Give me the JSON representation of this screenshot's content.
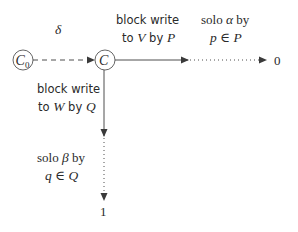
{
  "nodes": {
    "c0": {
      "label": "C",
      "subscript": "0"
    },
    "c": {
      "label": "C"
    },
    "out0": {
      "label": "0"
    },
    "out1": {
      "label": "1"
    }
  },
  "edges": {
    "delta": {
      "label": "δ",
      "style": "dashed"
    },
    "write_v": {
      "line1": "block  write",
      "line2_pre": "to ",
      "line2_var": "V",
      "line2_mid": " by ",
      "line2_var2": "P",
      "style": "solid"
    },
    "solo_alpha": {
      "line1_pre": "solo ",
      "line1_var": "α",
      "line1_post": " by",
      "line2": "p ∈ P",
      "style": "dotted"
    },
    "write_w": {
      "line1": "block  write",
      "line2_pre": "to ",
      "line2_var": "W",
      "line2_mid": " by ",
      "line2_var2": "Q",
      "style": "solid"
    },
    "solo_beta": {
      "line1_pre": "solo ",
      "line1_var": "β",
      "line1_post": " by",
      "line2": "q ∈ Q",
      "style": "dotted"
    }
  },
  "colors": {
    "stroke": "#3a3a3a",
    "text": "#2a2a2a",
    "background": "#ffffff"
  }
}
